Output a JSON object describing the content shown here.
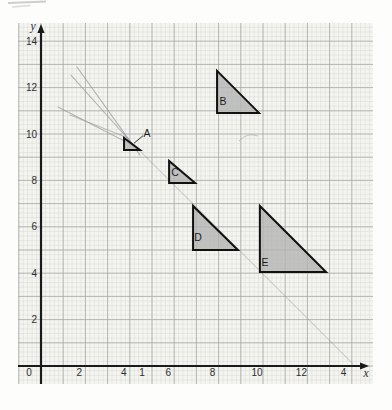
{
  "figure_title": "",
  "chart_data": {
    "type": "scatter",
    "figure_kind": "graph-paper coordinate grid with five grey right-angled triangles (enlargement exercise) and faint pencil construction lines",
    "title": "",
    "x_axis": {
      "label": "x",
      "range": [
        0,
        14.9
      ],
      "tick_labels": [
        {
          "v": 2,
          "t": "2"
        },
        {
          "v": 4,
          "t": "4"
        },
        {
          "v": 6,
          "t": "6"
        },
        {
          "v": 8,
          "t": "8"
        },
        {
          "v": 10,
          "t": "10"
        },
        {
          "v": 12,
          "t": "12"
        },
        {
          "v": 13.9,
          "t": "4"
        }
      ],
      "stray_label": {
        "v": 4.37,
        "t": "1"
      }
    },
    "y_axis": {
      "label": "y",
      "range": [
        0,
        14.9
      ],
      "tick_labels": [
        {
          "v": 14,
          "t": "14"
        },
        {
          "v": 12,
          "t": "12"
        },
        {
          "v": 10,
          "t": "10"
        },
        {
          "v": 8,
          "t": "8"
        },
        {
          "v": 6,
          "t": "6"
        },
        {
          "v": 4,
          "t": "4"
        },
        {
          "v": 2,
          "t": "2"
        }
      ]
    },
    "origin_label": "0",
    "grid": {
      "on": true,
      "minor_per_unit": 5
    },
    "shapes": [
      {
        "label": "A",
        "vertices": [
          [
            3.74,
            9.83
          ],
          [
            3.74,
            9.31
          ],
          [
            4.46,
            9.31
          ]
        ],
        "label_pos": [
          4.77,
          10.04
        ],
        "label_outside": true,
        "leader": [
          [
            4.6,
            9.93
          ],
          [
            4.19,
            9.6
          ]
        ]
      },
      {
        "label": "B",
        "vertices": [
          [
            7.93,
            12.72
          ],
          [
            7.93,
            10.91
          ],
          [
            9.82,
            10.91
          ]
        ],
        "label_pos": [
          8.2,
          11.38
        ]
      },
      {
        "label": "C",
        "vertices": [
          [
            5.77,
            8.84
          ],
          [
            5.77,
            7.89
          ],
          [
            6.94,
            7.89
          ]
        ],
        "label_pos": [
          6.04,
          8.32
        ]
      },
      {
        "label": "D",
        "vertices": [
          [
            6.85,
            6.9
          ],
          [
            6.85,
            5.0
          ],
          [
            8.87,
            5.0
          ]
        ],
        "label_pos": [
          7.07,
          5.52
        ]
      },
      {
        "label": "E",
        "vertices": [
          [
            9.86,
            6.9
          ],
          [
            9.86,
            4.05
          ],
          [
            12.84,
            4.05
          ]
        ],
        "label_pos": [
          10.09,
          4.48
        ]
      }
    ],
    "pencil_lines": [
      {
        "pts": [
          [
            1.62,
            12.89
          ],
          [
            4.46,
            9.09
          ]
        ],
        "opacity": 0.75
      },
      {
        "pts": [
          [
            1.35,
            12.54
          ],
          [
            4.37,
            9.31
          ]
        ],
        "opacity": 0.7
      },
      {
        "pts": [
          [
            0.77,
            11.16
          ],
          [
            4.28,
            9.44
          ]
        ],
        "opacity": 0.7
      },
      {
        "pts": [
          [
            1.31,
            10.82
          ],
          [
            3.92,
            9.83
          ]
        ],
        "opacity": 0.6
      },
      {
        "pts": [
          [
            4.14,
            9.57
          ],
          [
            14.05,
            0.09
          ]
        ],
        "opacity": 0.42
      }
    ],
    "colors": {
      "paper": "#f4f4f1",
      "grid_minor": "#d8d8d4",
      "grid_major": "#a9a9a5",
      "axis": "#1a1a1a",
      "triangle_fill": "#b4b4b4",
      "triangle_stroke": "#111111",
      "pencil": "#9c9c9c",
      "label": "#1c1c1c",
      "tick_text": "#2e2e2e"
    }
  }
}
